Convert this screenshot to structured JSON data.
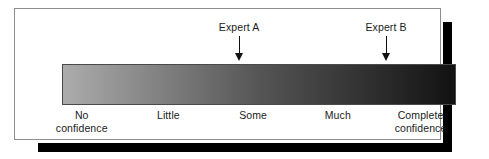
{
  "figure": {
    "background_color": "#ffffff",
    "frame_border_color": "#8d8d8d",
    "shadow_color": "#000000"
  },
  "scale_bar": {
    "gradient_start_color": "#acacac",
    "gradient_mid_color": "#555555",
    "gradient_end_color": "#121212",
    "border_color": "#4a4a4a"
  },
  "markers": [
    {
      "label": "Expert A",
      "position_percent": 48.5,
      "arrow": "down-arrow-icon"
    },
    {
      "label": "Expert B",
      "position_percent": 85.8,
      "arrow": "down-arrow-icon"
    }
  ],
  "scale_labels": [
    {
      "line1": "No",
      "line2": "confidence",
      "position_percent": 5.0
    },
    {
      "line1": "Little",
      "line2": "",
      "position_percent": 27.0
    },
    {
      "line1": "Some",
      "line2": "",
      "position_percent": 48.5
    },
    {
      "line1": "Much",
      "line2": "",
      "position_percent": 70.0
    },
    {
      "line1": "Complete",
      "line2": "confidence",
      "position_percent": 91.0
    }
  ],
  "chart_data": {
    "type": "heatmap",
    "xlabel": "",
    "ylabel": "",
    "categories": [
      "No confidence",
      "Little",
      "Some",
      "Much",
      "Complete confidence"
    ],
    "category_positions": [
      5.0,
      27.0,
      48.5,
      70.0,
      91.0
    ],
    "xlim": [
      0,
      100
    ],
    "grid": false,
    "legend": "none",
    "gradient": {
      "direction": "horizontal",
      "stops": [
        {
          "position": 0,
          "color": "#acacac"
        },
        {
          "position": 50,
          "color": "#555555"
        },
        {
          "position": 100,
          "color": "#121212"
        }
      ]
    },
    "annotations": [
      {
        "text": "Expert A",
        "x": 48.5,
        "marker": "down-arrow"
      },
      {
        "text": "Expert B",
        "x": 85.8,
        "marker": "down-arrow"
      }
    ]
  }
}
